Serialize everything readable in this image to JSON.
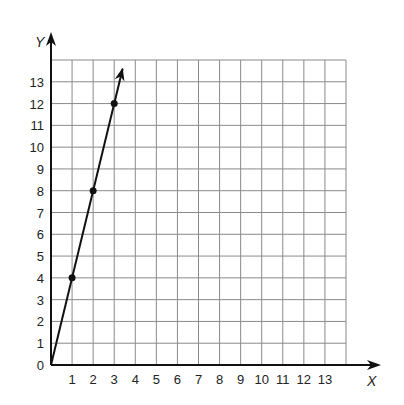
{
  "chart_data": {
    "type": "line",
    "title": "",
    "xlabel": "X",
    "ylabel": "Y",
    "xlim": [
      0,
      14
    ],
    "ylim": [
      0,
      14
    ],
    "grid": true,
    "x_ticks": [
      "1",
      "2",
      "3",
      "4",
      "5",
      "6",
      "7",
      "8",
      "9",
      "10",
      "11",
      "12",
      "13"
    ],
    "y_ticks": [
      "0",
      "1",
      "2",
      "3",
      "4",
      "5",
      "6",
      "7",
      "8",
      "9",
      "10",
      "11",
      "12",
      "13"
    ],
    "series": [
      {
        "name": "line",
        "points": [
          {
            "x": 0,
            "y": 0
          },
          {
            "x": 1,
            "y": 4
          },
          {
            "x": 2,
            "y": 8
          },
          {
            "x": 3,
            "y": 12
          }
        ],
        "marked_points": [
          {
            "x": 1,
            "y": 4
          },
          {
            "x": 2,
            "y": 8
          },
          {
            "x": 3,
            "y": 12
          }
        ],
        "slope": 4,
        "extends_with_arrow": true
      }
    ],
    "colors": {
      "line": "#111111",
      "grid": "#8a8a8a",
      "axis": "#111111"
    }
  }
}
